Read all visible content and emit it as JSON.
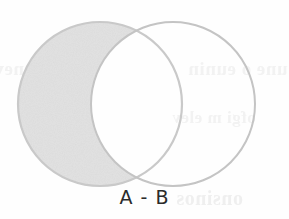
{
  "figure": {
    "caption": "A - B",
    "alt_label": "venn-diagram-set-difference",
    "background_color": "#fefefe"
  },
  "diagram": {
    "type": "venn",
    "shaded_region": "A only",
    "circles": [
      {
        "id": "A",
        "name": "left-circle",
        "cx": 100,
        "cy": 104,
        "r": 82,
        "filled": true,
        "fill_color": "#e6e6e6",
        "stroke_color": "#c9c9c9"
      },
      {
        "id": "B",
        "name": "right-circle",
        "cx": 173,
        "cy": 104,
        "r": 82,
        "filled": false,
        "fill_color": "#ffffff",
        "stroke_color": "#c4c4c4"
      }
    ],
    "intersection": {
      "shaded": false,
      "fill_color": "#ffffff"
    }
  },
  "ghost": {
    "line_a": "esldenev",
    "line_b": "une o eunin",
    "line_c": "ofgi m elev",
    "line_d": "onsinos"
  }
}
